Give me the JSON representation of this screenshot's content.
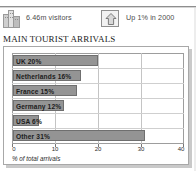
{
  "top_partial_row": {
    "ghost_text_1": "",
    "ghost_text_2": "",
    "ghost_text_3": ""
  },
  "stats": [
    {
      "icon": "buildings-icon",
      "value": "6.46m visitors"
    },
    {
      "icon": "up-arrow-icon",
      "value": "Up 1% in 2000"
    }
  ],
  "chart_title": "MAIN TOURIST ARRIVALS",
  "colors": {
    "bar_fill": "#949494",
    "bar_stroke": "#6f6f6f",
    "grid": "#c4c4c4",
    "frame": "#a8a8a8",
    "text": "#1b1b1b"
  },
  "chart_data": {
    "type": "bar",
    "orientation": "horizontal",
    "title": "MAIN TOURIST ARRIVALS",
    "categories": [
      "UK",
      "Netherlands",
      "France",
      "Germany",
      "USA",
      "Other"
    ],
    "values": [
      20,
      16,
      15,
      12,
      6,
      31
    ],
    "bar_labels": [
      "UK 20%",
      "Netherlands 16%",
      "France 15%",
      "Germany 12%",
      "USA 6%",
      "Other  31%"
    ],
    "xlabel": "% of total arrivals",
    "ylabel": "",
    "xlim": [
      0,
      40
    ],
    "xticks": [
      0,
      10,
      20,
      30,
      40
    ],
    "xtick_labels": [
      "0",
      "10",
      "20",
      "30",
      "40"
    ],
    "grid": true,
    "legend": false
  }
}
